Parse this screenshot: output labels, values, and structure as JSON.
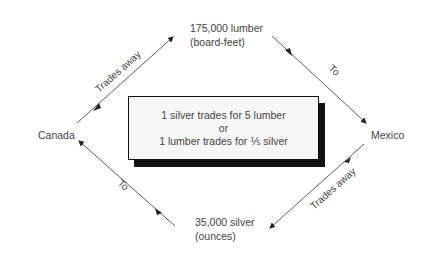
{
  "diagram": {
    "nodes": {
      "top": {
        "line1": "175,000 lumber",
        "line2": "(board-feet)"
      },
      "bottom": {
        "line1": "35,000 silver",
        "line2": "(ounces)"
      },
      "left": {
        "label": "Canada"
      },
      "right": {
        "label": "Mexico"
      }
    },
    "center_box": {
      "line1": "1 silver trades for 5 lumber",
      "line2": "or",
      "line3": "1 lumber trades for ⅕ silver"
    },
    "edges": [
      {
        "from": "Canada",
        "to": "175,000 lumber",
        "label": "Trades away"
      },
      {
        "from": "175,000 lumber",
        "to": "Mexico",
        "label": "To"
      },
      {
        "from": "Mexico",
        "to": "35,000 silver",
        "label": "Trades away"
      },
      {
        "from": "35,000 silver",
        "to": "Canada",
        "label": "To"
      }
    ],
    "colors": {
      "line": "#333333",
      "box_fill": "#f7f7f7",
      "box_shadow": "#111111",
      "text": "#444444"
    }
  }
}
